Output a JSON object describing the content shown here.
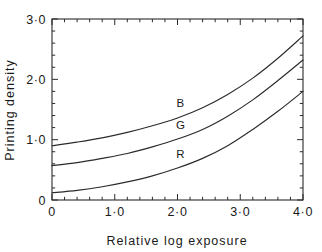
{
  "chart_data": {
    "type": "line",
    "title": "",
    "xlabel": "Relative log exposure",
    "ylabel": "Printing density",
    "xlim": [
      0,
      4.0
    ],
    "ylim": [
      0,
      3.0
    ],
    "grid": false,
    "legend_position": "inline-curve-labels",
    "x_ticks": [
      {
        "value": 0,
        "label": "0"
      },
      {
        "value": 1.0,
        "label": "1·0"
      },
      {
        "value": 2.0,
        "label": "2·0"
      },
      {
        "value": 3.0,
        "label": "3·0"
      },
      {
        "value": 4.0,
        "label": "4·0"
      }
    ],
    "y_ticks": [
      {
        "value": 0,
        "label": "0"
      },
      {
        "value": 1.0,
        "label": "1·0"
      },
      {
        "value": 2.0,
        "label": "2·0"
      },
      {
        "value": 3.0,
        "label": "3·0"
      }
    ],
    "x_minor_tick_step": 0.2,
    "y_minor_tick_step": 0.2,
    "x": [
      0,
      0.4,
      0.8,
      1.2,
      1.6,
      2.0,
      2.4,
      2.8,
      3.2,
      3.6,
      4.0
    ],
    "series": [
      {
        "name": "B",
        "label": "B",
        "label_x": 2.05,
        "label_y": 1.54,
        "values": [
          0.9,
          0.96,
          1.03,
          1.12,
          1.23,
          1.36,
          1.53,
          1.75,
          2.02,
          2.35,
          2.72
        ]
      },
      {
        "name": "G",
        "label": "G",
        "label_x": 2.05,
        "label_y": 1.18,
        "values": [
          0.57,
          0.62,
          0.69,
          0.77,
          0.88,
          1.01,
          1.17,
          1.39,
          1.66,
          1.98,
          2.32
        ]
      },
      {
        "name": "R",
        "label": "R",
        "label_x": 2.05,
        "label_y": 0.7,
        "values": [
          0.12,
          0.16,
          0.22,
          0.3,
          0.4,
          0.53,
          0.69,
          0.9,
          1.17,
          1.47,
          1.8
        ]
      }
    ],
    "colors": {
      "axis": "#2b2b2b",
      "curve": "#2b2b2b",
      "background": "#ffffff",
      "text": "#1a1a1a"
    }
  }
}
